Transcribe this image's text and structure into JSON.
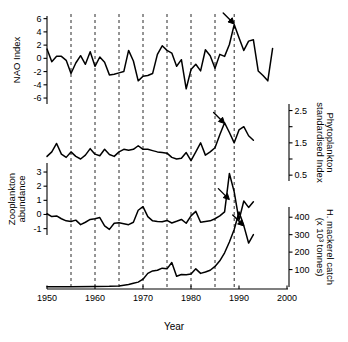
{
  "chart_data": {
    "type": "line",
    "title": "",
    "xlabel": "Year",
    "xlim": [
      1950,
      2000
    ],
    "x_ticks": [
      1950,
      1960,
      1970,
      1980,
      1990,
      2000
    ],
    "x_tick_labels": [
      "1950",
      "1960",
      "1970",
      "1980",
      "1990",
      "2000"
    ],
    "grid": false,
    "legend": "none",
    "event_lines": {
      "label": "regime-shift marker years",
      "years": [
        1955,
        1960,
        1965,
        1970,
        1975,
        1980,
        1985,
        1989
      ],
      "style": "dashed-vertical"
    },
    "annotations": [
      {
        "name": "nao-arrow",
        "panel": "nao_index",
        "year": 1989,
        "value": 5.2,
        "label": ""
      },
      {
        "name": "phytoplankton-arrow",
        "panel": "phytoplankton",
        "year": 1987,
        "value": 2.1,
        "label": ""
      },
      {
        "name": "zooplankton-arrow",
        "panel": "zooplankton",
        "year": 1988,
        "value": 1.05,
        "label": ""
      },
      {
        "name": "mackerel-arrow",
        "panel": "mackerel_catch",
        "year": 1991,
        "value": 350,
        "label": ""
      }
    ],
    "panels": [
      {
        "name": "nao_index",
        "ylabel": "NAO Index",
        "axis_side": "left",
        "ylim": [
          -6.9,
          6.4
        ],
        "y_ticks": [
          -6,
          -4,
          -2,
          0,
          2,
          4,
          6
        ],
        "y_tick_labels": [
          "-6",
          "-4",
          "-2",
          "0",
          "2",
          "4",
          "6"
        ],
        "years": [
          1950,
          1951,
          1952,
          1953,
          1954,
          1955,
          1956,
          1957,
          1958,
          1959,
          1960,
          1961,
          1962,
          1963,
          1964,
          1965,
          1966,
          1967,
          1968,
          1969,
          1970,
          1971,
          1972,
          1973,
          1974,
          1975,
          1976,
          1977,
          1978,
          1979,
          1980,
          1981,
          1982,
          1983,
          1984,
          1985,
          1986,
          1987,
          1988,
          1989,
          1990,
          1991,
          1992,
          1993,
          1994,
          1995,
          1996,
          1997
        ],
        "values": [
          1.4,
          -0.5,
          0.3,
          0.3,
          -0.3,
          -2.3,
          -0.7,
          0.4,
          -0.9,
          1.0,
          -1.2,
          0.2,
          -0.6,
          -2.5,
          -2.4,
          -2.2,
          -2.0,
          1.2,
          -0.4,
          -3.4,
          -2.7,
          -2.6,
          -2.3,
          0.6,
          1.9,
          1.2,
          0.8,
          -1.2,
          -0.2,
          -4.6,
          -1.7,
          -0.9,
          -1.9,
          1.3,
          0.4,
          -1.5,
          0.6,
          0.3,
          2.1,
          5.1,
          3.1,
          1.2,
          2.6,
          2.8,
          -1.9,
          -2.6,
          -3.4,
          1.5
        ]
      },
      {
        "name": "phytoplankton",
        "ylabel": "Phytoplankton standardised Index",
        "axis_side": "right",
        "ylim": [
          0.35,
          2.95
        ],
        "y_ticks": [
          0.5,
          1.0,
          1.5,
          2.0,
          2.5
        ],
        "y_tick_labels": [
          "0.5",
          "",
          "1.5",
          "",
          "2.5"
        ],
        "years": [
          1950,
          1951,
          1952,
          1953,
          1954,
          1955,
          1956,
          1957,
          1958,
          1959,
          1960,
          1961,
          1962,
          1963,
          1964,
          1965,
          1966,
          1967,
          1968,
          1969,
          1970,
          1971,
          1972,
          1973,
          1974,
          1975,
          1976,
          1977,
          1978,
          1979,
          1980,
          1981,
          1982,
          1983,
          1984,
          1985,
          1986,
          1987,
          1988,
          1989,
          1990,
          1991,
          1992,
          1993
        ],
        "values": [
          1.08,
          1.22,
          1.48,
          1.15,
          1.05,
          1.22,
          1.08,
          1.0,
          1.12,
          1.32,
          1.15,
          1.1,
          1.3,
          1.14,
          1.08,
          1.22,
          1.3,
          1.27,
          1.3,
          1.41,
          1.3,
          1.3,
          1.26,
          1.22,
          1.2,
          1.18,
          1.05,
          1.0,
          1.02,
          1.2,
          0.95,
          1.22,
          1.5,
          1.12,
          1.22,
          1.35,
          1.75,
          2.12,
          1.82,
          1.5,
          1.9,
          2.0,
          1.72,
          1.58
        ]
      },
      {
        "name": "zooplankton",
        "ylabel": "Zooplankton abundance",
        "axis_side": "left",
        "ylim": [
          -1.45,
          3.85
        ],
        "y_ticks": [
          -1,
          0,
          1,
          2,
          3
        ],
        "y_tick_labels": [
          "-1",
          "0",
          "1",
          "2",
          "3"
        ],
        "years": [
          1950,
          1951,
          1952,
          1953,
          1954,
          1955,
          1956,
          1957,
          1958,
          1959,
          1960,
          1961,
          1962,
          1963,
          1964,
          1965,
          1966,
          1967,
          1968,
          1969,
          1970,
          1971,
          1972,
          1973,
          1974,
          1975,
          1976,
          1977,
          1978,
          1979,
          1980,
          1981,
          1982,
          1983,
          1984,
          1985,
          1986,
          1987,
          1988,
          1989,
          1990,
          1991,
          1992,
          1993
        ],
        "values": [
          0.05,
          -0.15,
          -0.1,
          -0.3,
          -0.45,
          -0.5,
          -0.4,
          -0.72,
          -0.55,
          -0.35,
          -0.3,
          -0.22,
          -0.8,
          -1.05,
          -0.62,
          -0.58,
          -0.65,
          -0.72,
          -0.55,
          0.3,
          0.55,
          -0.15,
          -0.45,
          -0.5,
          -0.52,
          -0.42,
          -0.6,
          -0.48,
          -0.35,
          -0.62,
          -0.1,
          0.22,
          -0.55,
          -0.5,
          -0.45,
          -0.3,
          -0.1,
          0.18,
          2.9,
          1.6,
          -0.4,
          0.95,
          0.5,
          0.9
        ]
      },
      {
        "name": "mackerel_catch",
        "ylabel": "H. mackerel catch (x 10³ tonnes)",
        "axis_side": "right",
        "ylim": [
          0,
          470
        ],
        "y_ticks": [
          100,
          200,
          300,
          400
        ],
        "y_tick_labels": [
          "100",
          "200",
          "300",
          "400"
        ],
        "years": [
          1950,
          1955,
          1960,
          1963,
          1965,
          1966,
          1967,
          1968,
          1969,
          1970,
          1971,
          1972,
          1973,
          1974,
          1975,
          1976,
          1977,
          1978,
          1979,
          1980,
          1981,
          1982,
          1983,
          1984,
          1985,
          1986,
          1987,
          1988,
          1989,
          1990,
          1991,
          1992,
          1993
        ],
        "values": [
          2,
          2,
          3,
          4,
          6,
          10,
          14,
          22,
          28,
          45,
          78,
          92,
          96,
          108,
          104,
          140,
          62,
          72,
          70,
          74,
          104,
          78,
          86,
          96,
          118,
          150,
          196,
          258,
          330,
          430,
          352,
          252,
          300
        ]
      }
    ]
  }
}
